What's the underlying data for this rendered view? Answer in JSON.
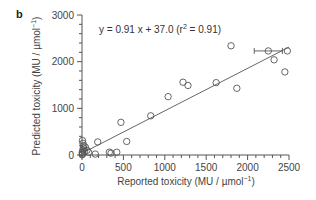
{
  "panel_label": "b",
  "equation": {
    "prefix": "y = 0.91 x + 37.0 (r",
    "sup": "2",
    "suffix": " = 0.91)"
  },
  "axes": {
    "xlabel_prefix": "Reported toxicity (MU / µmol",
    "xlabel_sup": "−1",
    "xlabel_suffix": ")",
    "ylabel_prefix": "Predicted toxicity (MU / µmol",
    "ylabel_sup": "−1",
    "ylabel_suffix": ")"
  },
  "chart_data": {
    "type": "scatter",
    "title": "",
    "panel": "b",
    "xlabel": "Reported toxicity (MU / µmol⁻¹)",
    "ylabel": "Predicted toxicity (MU / µmol⁻¹)",
    "xlim": [
      0,
      2500
    ],
    "ylim": [
      0,
      3000
    ],
    "xticks": [
      0,
      500,
      1000,
      1500,
      2000,
      2500
    ],
    "yticks": [
      0,
      1000,
      2000,
      3000
    ],
    "x_minor_step": 100,
    "y_minor_step": 200,
    "grid": false,
    "legend": null,
    "annotation": "y = 0.91 x + 37.0 (r² = 0.91)",
    "fit_line": {
      "slope": 0.91,
      "intercept": 37.0,
      "r2": 0.91,
      "x_range": [
        0,
        2500
      ]
    },
    "marker": "open-circle",
    "points": [
      {
        "x": 2,
        "y": 5
      },
      {
        "x": 5,
        "y": 20
      },
      {
        "x": 8,
        "y": 40
      },
      {
        "x": 3,
        "y": 60
      },
      {
        "x": 10,
        "y": 100
      },
      {
        "x": 15,
        "y": 150
      },
      {
        "x": 20,
        "y": 200
      },
      {
        "x": 12,
        "y": 250
      },
      {
        "x": 5,
        "y": 310
      },
      {
        "x": 30,
        "y": 80
      },
      {
        "x": 40,
        "y": 170
      },
      {
        "x": 60,
        "y": 100
      },
      {
        "x": 80,
        "y": 60
      },
      {
        "x": 160,
        "y": 20
      },
      {
        "x": 190,
        "y": 280
      },
      {
        "x": 330,
        "y": 60
      },
      {
        "x": 350,
        "y": 40
      },
      {
        "x": 420,
        "y": 60
      },
      {
        "x": 470,
        "y": 700
      },
      {
        "x": 540,
        "y": 290
      },
      {
        "x": 830,
        "y": 840
      },
      {
        "x": 1040,
        "y": 1250
      },
      {
        "x": 1220,
        "y": 1560
      },
      {
        "x": 1280,
        "y": 1490
      },
      {
        "x": 1620,
        "y": 1550
      },
      {
        "x": 1800,
        "y": 2340
      },
      {
        "x": 1870,
        "y": 1430
      },
      {
        "x": 2250,
        "y": 2230,
        "xerr": [
          2080,
          2420
        ]
      },
      {
        "x": 2320,
        "y": 2040
      },
      {
        "x": 2480,
        "y": 2230
      },
      {
        "x": 2450,
        "y": 1780
      }
    ]
  }
}
